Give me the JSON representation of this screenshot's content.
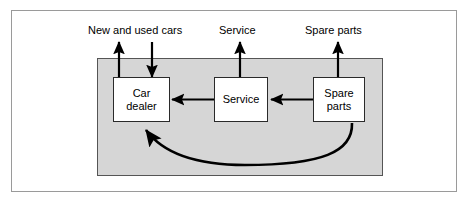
{
  "diagram": {
    "title_text": "",
    "colors": {
      "region_fill": "#d6d6d6",
      "region_border": "#555555",
      "box_fill": "#ffffff",
      "box_border": "#2a2a2a",
      "arrow": "#000000",
      "outer_frame": "#9a9a9a"
    },
    "output_labels": [
      {
        "id": "new-and-used-cars",
        "text": "New and used cars"
      },
      {
        "id": "service",
        "text": "Service"
      },
      {
        "id": "spare-parts",
        "text": "Spare parts"
      }
    ],
    "nodes": [
      {
        "id": "car-dealer",
        "text": "Car\ndealer"
      },
      {
        "id": "service",
        "text": "Service"
      },
      {
        "id": "spare-parts",
        "text": "Spare\nparts"
      }
    ],
    "edges": [
      {
        "id": "car-dealer-to-new-and-used-cars",
        "from": "car-dealer",
        "to": "new-and-used-cars",
        "direction": "up",
        "style": "straight"
      },
      {
        "id": "new-and-used-cars-to-car-dealer",
        "from": "new-and-used-cars",
        "to": "car-dealer",
        "direction": "down",
        "style": "straight"
      },
      {
        "id": "service-to-service-output",
        "from": "service",
        "to": "service",
        "direction": "up",
        "style": "straight"
      },
      {
        "id": "spare-parts-to-spare-parts-output",
        "from": "spare-parts",
        "to": "spare-parts",
        "direction": "up",
        "style": "straight"
      },
      {
        "id": "service-to-car-dealer",
        "from": "service",
        "to": "car-dealer",
        "direction": "left",
        "style": "straight"
      },
      {
        "id": "spare-parts-to-service",
        "from": "spare-parts",
        "to": "service",
        "direction": "left",
        "style": "straight"
      },
      {
        "id": "spare-parts-to-car-dealer",
        "from": "spare-parts",
        "to": "car-dealer",
        "direction": "left",
        "style": "curved"
      }
    ]
  }
}
